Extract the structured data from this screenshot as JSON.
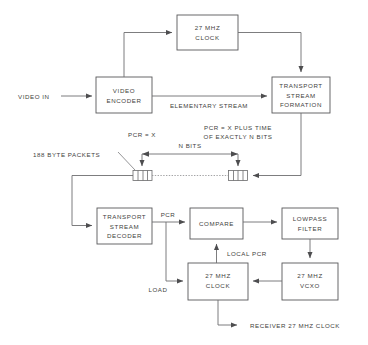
{
  "figure": {
    "colors": {
      "stroke": "#6e6e70",
      "box_stroke": "#58585a",
      "text": "#3f3f41",
      "background": "#ffffff"
    }
  },
  "blocks": {
    "clock_encoder": {
      "line1": "27  MHZ",
      "line2": "CLOCK"
    },
    "video_encoder": {
      "line1": "VIDEO",
      "line2": "ENCODER"
    },
    "ts_formation": {
      "line1": "TRANSPORT",
      "line2": "STREAM",
      "line3": "FORMATION"
    },
    "ts_decoder": {
      "line1": "TRANSPORT",
      "line2": "STREAM",
      "line3": "DECODER"
    },
    "compare": {
      "line1": "COMPARE"
    },
    "lowpass": {
      "line1": "LOWPASS",
      "line2": "FILTER"
    },
    "clock_decoder": {
      "line1": "27  MHZ",
      "line2": "CLOCK"
    },
    "vcxo": {
      "line1": "27  MHZ",
      "line2": "VCXO"
    }
  },
  "labels": {
    "video_in": "VIDEO  IN",
    "elementary_stream": "ELEMENTARY  STREAM",
    "pcr_x": "PCR  =  X",
    "pcr_plus_l1": "PCR  =  X  PLUS  TIME",
    "pcr_plus_l2": "OF  EXACTLY  N  BITS",
    "n_bits": "N  BITS",
    "packets": "188  BYTE  PACKETS",
    "pcr": "PCR",
    "local_pcr": "LOCAL  PCR",
    "load": "LOAD",
    "receiver_clock": "RECEIVER  27  MHZ  CLOCK"
  }
}
